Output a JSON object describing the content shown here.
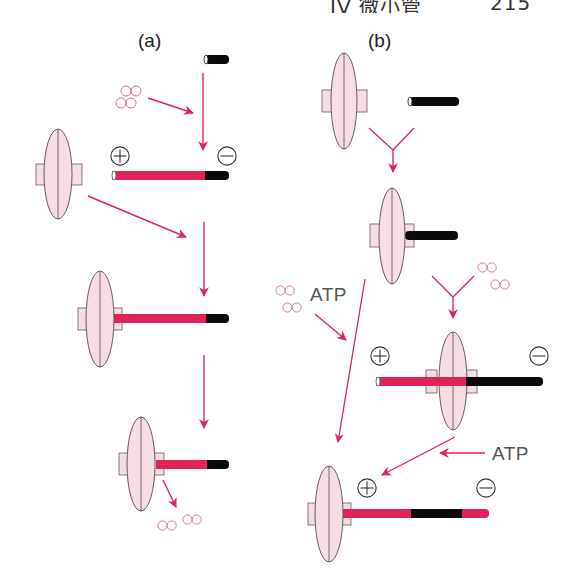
{
  "header": {
    "title": "IV 微小管",
    "page_number": "215"
  },
  "panels": {
    "a": {
      "label": "(a)"
    },
    "b": {
      "label": "(b)"
    }
  },
  "labels": {
    "atp_1": "ATP",
    "atp_2": "ATP",
    "plus_symbol": "+",
    "minus_symbol": "−"
  },
  "colors": {
    "red_filament": "#e0245a",
    "black_filament": "#0a0a0a",
    "arrow": "#e0245a",
    "organizer_fill": "#f6dde4",
    "organizer_stroke": "#6a5a5e",
    "dimer_stroke": "#e06a8c",
    "text": "#333333"
  },
  "legend_semantics": {
    "ellipse_with_tabs": "microtubule-organizing-center / capping complex",
    "black_bar": "seed / black segment",
    "red_bar": "growing red segment",
    "double_circles": "tubulin dimers"
  }
}
